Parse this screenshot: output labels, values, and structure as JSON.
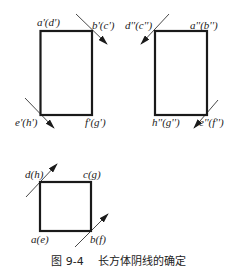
{
  "figure": {
    "number": "图 9-4",
    "title": "长方体阴线的确定"
  },
  "front_view": {
    "labels": {
      "top_left": "a'(d')",
      "top_right": "b'(c')",
      "bottom_left": "e'(h')",
      "bottom_right": "f'(g')"
    }
  },
  "side_view": {
    "labels": {
      "top_left": "d''(c'')",
      "top_right": "a''(b'')",
      "bottom_left": "h''(g'')",
      "bottom_right": "e''(f'')"
    }
  },
  "top_view": {
    "labels": {
      "top_left": "d(h)",
      "top_right": "c(g)",
      "bottom_left": "a(e)",
      "bottom_right": "b(f)"
    }
  },
  "colors": {
    "stroke": "#1a1a1a",
    "background": "#ffffff"
  }
}
